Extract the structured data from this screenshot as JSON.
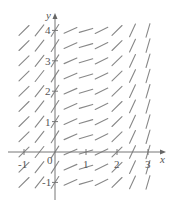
{
  "chart_data": {
    "type": "slope_field",
    "title": "",
    "xlabel": "x",
    "ylabel": "y",
    "xlim": [
      -1,
      3
    ],
    "ylim": [
      -1,
      4
    ],
    "x_ticks": [
      "-1",
      "0",
      "1",
      "2",
      "3"
    ],
    "y_ticks": [
      "-1",
      "1",
      "2",
      "3",
      "4"
    ],
    "grid_step": 0.5,
    "columns_x": [
      -1,
      -0.5,
      0,
      0.5,
      1,
      1.5,
      2,
      2.5,
      3
    ],
    "rows_y": [
      -1,
      -0.5,
      0,
      0.5,
      1,
      1.5,
      2,
      2.5,
      3,
      3.5,
      4
    ],
    "slopes_by_column": [
      1.0,
      1.3,
      1.6,
      0.45,
      0.3,
      0.5,
      1.0,
      2.2,
      3.5
    ],
    "slope_depends_on": "x only"
  },
  "labels": {
    "x_axis": "x",
    "y_axis": "y",
    "origin": "0"
  },
  "colors": {
    "axis": "#777777",
    "segment": "#888888",
    "text": "#555555"
  }
}
